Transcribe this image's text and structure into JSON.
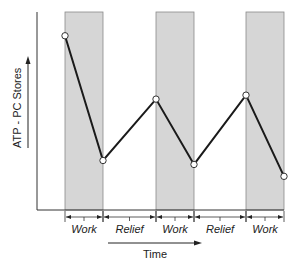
{
  "chart_data": {
    "type": "line",
    "title": "",
    "xlabel": "Time",
    "ylabel": "ATP - PC Stores",
    "grid": false,
    "legend": null,
    "phases": [
      "Work",
      "Relief",
      "Work",
      "Relief",
      "Work"
    ],
    "shaded_phase": "Work",
    "points": [
      {
        "x": 0,
        "y": 88,
        "phase_boundary": "start of Work 1"
      },
      {
        "x": 1,
        "y": 25,
        "phase_boundary": "end of Work 1"
      },
      {
        "x": 2,
        "y": 56,
        "phase_boundary": "end of Relief 1"
      },
      {
        "x": 3,
        "y": 23,
        "phase_boundary": "end of Work 2"
      },
      {
        "x": 4,
        "y": 58,
        "phase_boundary": "end of Relief 2"
      },
      {
        "x": 5,
        "y": 17,
        "phase_boundary": "end of Work 3"
      }
    ],
    "ylim": [
      0,
      100
    ],
    "annotations": [
      "Y axis arrow pointing up (increasing stores)",
      "X axis arrow pointing right (Time)"
    ]
  },
  "colors": {
    "band": "#d6d6d6",
    "band_edge": "#8a8a8a",
    "line": "#1a1a1a",
    "axis": "#333333",
    "marker_fill": "#ffffff"
  },
  "labels": {
    "y_axis": "ATP - PC Stores",
    "x_axis": "Time",
    "segments": [
      "Work",
      "Relief",
      "Work",
      "Relief",
      "Work"
    ]
  }
}
